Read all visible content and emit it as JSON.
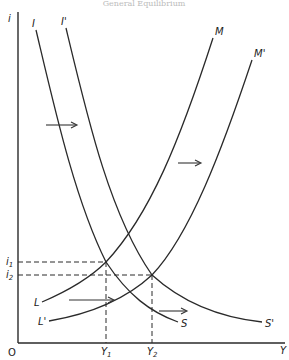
{
  "diagram": {
    "title": "General Equilibrium",
    "axes": {
      "y_label": "i",
      "x_label": "Y",
      "origin_label": "O"
    },
    "levels": {
      "i1": "i",
      "i1_sub": "1",
      "i2": "i",
      "i2_sub": "2",
      "Y1": "Y",
      "Y1_sub": "1",
      "Y2": "Y",
      "Y2_sub": "2"
    },
    "curves": [
      {
        "id": "IS",
        "top_label": "I",
        "bottom_label": "S",
        "type": "downward"
      },
      {
        "id": "IS_shifted",
        "top_label": "I'",
        "bottom_label": "S'",
        "type": "downward"
      },
      {
        "id": "LM",
        "bottom_label": "L",
        "top_label": "M",
        "type": "upward"
      },
      {
        "id": "LM_shifted",
        "bottom_label": "L'",
        "top_label": "M'",
        "type": "upward"
      }
    ],
    "arrows": [
      {
        "from": [
          46,
          125
        ],
        "to": [
          76,
          125
        ]
      },
      {
        "from": [
          180,
          163
        ],
        "to": [
          200,
          163
        ]
      },
      {
        "from": [
          69,
          300
        ],
        "to": [
          113,
          300
        ]
      },
      {
        "from": [
          159,
          311
        ],
        "to": [
          186,
          311
        ]
      }
    ],
    "equilibria": [
      {
        "name": "E1",
        "x_label": "Y1",
        "y_label": "i1"
      },
      {
        "name": "E2",
        "x_label": "Y2",
        "y_label": "i2"
      }
    ]
  }
}
